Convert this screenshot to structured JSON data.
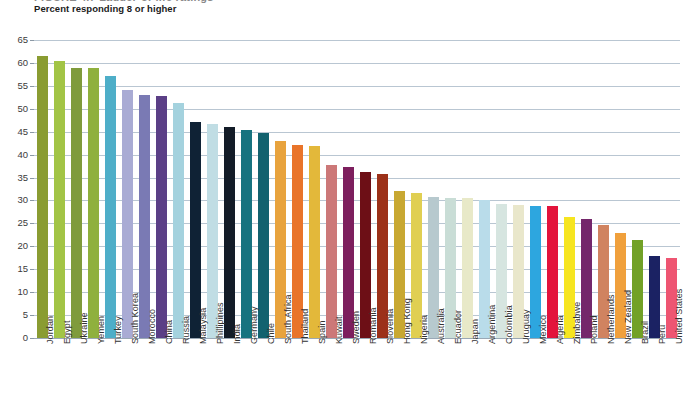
{
  "header": {
    "cut_title": "FIGURE 4.7   Ladder-of-life ratings",
    "subtitle": "Percent responding 8 or higher"
  },
  "chart_data": {
    "type": "bar",
    "title": "Percent responding 8 or higher",
    "xlabel": "",
    "ylabel": "",
    "ylim": [
      0,
      65
    ],
    "ytick_step": 5,
    "yticks": [
      "0",
      "5",
      "10",
      "15",
      "20",
      "25",
      "30",
      "35",
      "40",
      "45",
      "50",
      "55",
      "60",
      "65"
    ],
    "grid": true,
    "legend": "none",
    "categories": [
      "Jordan",
      "Egypt",
      "Ukraine",
      "Yemen",
      "Turkey",
      "South Korea",
      "Morocco",
      "China",
      "Russia",
      "Malaysia",
      "Phillipines",
      "India",
      "Germany",
      "Chile",
      "South Africa",
      "Thailand",
      "Spain",
      "Kuwait",
      "Sweden",
      "Romania",
      "Slovenia",
      "Hong Kong",
      "Nigeria",
      "Australia",
      "Ecuador",
      "Japan",
      "Argentina",
      "Colombia",
      "Uruguay",
      "Mexico",
      "Algeria",
      "Zimbabwe",
      "Poland",
      "Netherlands",
      "New Zealand",
      "Brazil",
      "Peru",
      "United States"
    ],
    "values": [
      61.5,
      60.5,
      59.0,
      58.8,
      57.2,
      54.2,
      53.0,
      52.7,
      51.3,
      47.2,
      46.7,
      46.0,
      45.3,
      44.7,
      43.0,
      42.0,
      41.8,
      37.8,
      37.2,
      36.2,
      35.8,
      32.0,
      31.7,
      30.7,
      30.5,
      30.6,
      30.2,
      29.2,
      29.0,
      28.9,
      28.8,
      26.3,
      26.0,
      24.7,
      23.0,
      21.3,
      17.8,
      17.5
    ],
    "colors": [
      "#8a9c32",
      "#a2c446",
      "#7f9b3c",
      "#8fb03e",
      "#4eaec8",
      "#a9abd4",
      "#7a7ab4",
      "#5b3f86",
      "#a4d2de",
      "#0f2235",
      "#c0dde4",
      "#131c28",
      "#17737f",
      "#12626f",
      "#e8a33d",
      "#e9742a",
      "#e3b83a",
      "#cc7878",
      "#7d1f5e",
      "#6d0f16",
      "#9c3119",
      "#c8a832",
      "#e0cf52",
      "#b7c9ce",
      "#c9ddd6",
      "#e8e9c8",
      "#b9dcea",
      "#d6e5e0",
      "#e9e7cb",
      "#2da6df",
      "#e3143c",
      "#f6e520",
      "#74276b",
      "#d08360",
      "#f0a03c",
      "#72a127",
      "#1b2263",
      "#ee5572",
      "#a5d243",
      "#37505e",
      "#f4a52a",
      "#d5171f"
    ]
  }
}
